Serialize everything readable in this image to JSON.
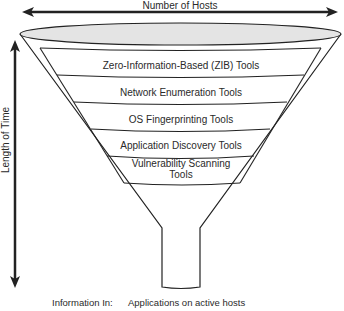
{
  "diagram": {
    "type": "funnel",
    "top_axis_label": "Number of Hosts",
    "side_axis_label": "Length of Time",
    "layers": [
      {
        "label": "Zero-Information-Based (ZIB) Tools"
      },
      {
        "label": "Network Enumeration Tools"
      },
      {
        "label": "OS Fingerprinting Tools"
      },
      {
        "label": "Application Discovery Tools"
      },
      {
        "label_line1": "Vulnerability Scanning",
        "label_line2": "Tools"
      }
    ],
    "footer": {
      "label": "Information In:",
      "value": "Applications on active hosts"
    },
    "colors": {
      "stroke": "#222222",
      "ellipse_fill": "#e4e4e4",
      "background": "#ffffff"
    }
  }
}
